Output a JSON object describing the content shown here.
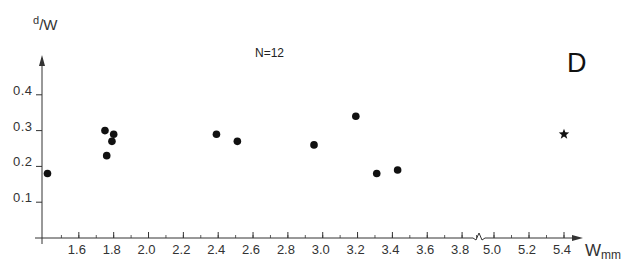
{
  "chart_data": {
    "type": "scatter",
    "panel": "D",
    "annotation": "N=12",
    "title": "",
    "xlabel": "W",
    "xlabel_sub": "mm",
    "ylabel_num": "d",
    "ylabel_den": "W",
    "xlim": [
      1.4,
      5.5
    ],
    "ylim": [
      0,
      0.5
    ],
    "axis_break": {
      "between": [
        3.8,
        5.0
      ]
    },
    "x_ticks": [
      "1.6",
      "1.8",
      "2.0",
      "2.2",
      "2.4",
      "2.6",
      "2.8",
      "3.0",
      "3.2",
      "3.4",
      "3.6",
      "3.8",
      "5.0",
      "5.2",
      "5.4"
    ],
    "y_ticks": [
      "0.1",
      "0.2",
      "0.3",
      "0.4"
    ],
    "grid": false,
    "series": [
      {
        "name": "points",
        "marker": "circle",
        "points": [
          {
            "x": 1.42,
            "y": 0.18
          },
          {
            "x": 1.75,
            "y": 0.3
          },
          {
            "x": 1.8,
            "y": 0.29
          },
          {
            "x": 1.79,
            "y": 0.27
          },
          {
            "x": 1.76,
            "y": 0.23
          },
          {
            "x": 2.39,
            "y": 0.29
          },
          {
            "x": 2.51,
            "y": 0.27
          },
          {
            "x": 2.95,
            "y": 0.26
          },
          {
            "x": 3.19,
            "y": 0.34
          },
          {
            "x": 3.31,
            "y": 0.18
          },
          {
            "x": 3.43,
            "y": 0.19
          }
        ]
      },
      {
        "name": "outlier",
        "marker": "star",
        "points": [
          {
            "x": 5.4,
            "y": 0.29
          }
        ]
      }
    ]
  }
}
